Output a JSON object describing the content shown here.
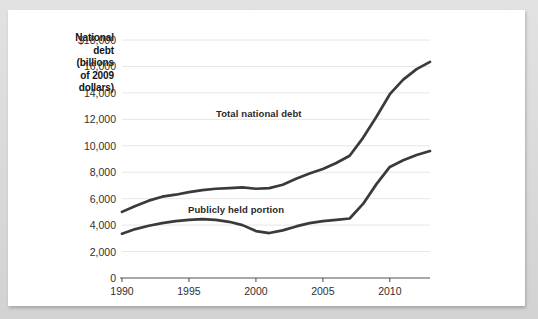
{
  "chart_data": {
    "type": "line",
    "title": "",
    "xlabel": "",
    "ylabel": "National debt (billions of 2009 dollars)",
    "ylabel_lines": [
      "National",
      "debt",
      "(billions",
      "of 2009",
      "dollars)"
    ],
    "xlim": [
      1990,
      2013
    ],
    "ylim": [
      0,
      18000
    ],
    "ytick_values": [
      0,
      2000,
      4000,
      6000,
      8000,
      10000,
      12000,
      14000,
      16000,
      18000
    ],
    "ytick_labels": [
      "0",
      "2,000",
      "4,000",
      "6,000",
      "8,000",
      "10,000",
      "12,000",
      "14,000",
      "16,000",
      "$18,000"
    ],
    "xtick_values": [
      1990,
      1995,
      2000,
      2005,
      2010
    ],
    "xtick_labels": [
      "1990",
      "1995",
      "2000",
      "2005",
      "2010"
    ],
    "grid": true,
    "grid_axis": "y",
    "legend_position": "inline-annotation",
    "line_color": "#3a3a3a",
    "grid_color": "#e6e6e6",
    "axis_color": "#555555",
    "x": [
      1990,
      1991,
      1992,
      1993,
      1994,
      1995,
      1996,
      1997,
      1998,
      1999,
      2000,
      2001,
      2002,
      2003,
      2004,
      2005,
      2006,
      2007,
      2008,
      2009,
      2010,
      2011,
      2012,
      2013
    ],
    "series": [
      {
        "name": "Total national debt",
        "values": [
          5000,
          5450,
          5850,
          6150,
          6300,
          6500,
          6650,
          6750,
          6800,
          6850,
          6750,
          6800,
          7050,
          7500,
          7900,
          8250,
          8700,
          9250,
          10600,
          12200,
          13900,
          15000,
          15800,
          16350
        ]
      },
      {
        "name": "Publicly held portion",
        "values": [
          3350,
          3700,
          3950,
          4150,
          4300,
          4400,
          4450,
          4400,
          4250,
          4000,
          3550,
          3400,
          3600,
          3900,
          4150,
          4300,
          4400,
          4500,
          5600,
          7100,
          8400,
          8900,
          9300,
          9600
        ]
      }
    ],
    "annotations": [
      {
        "text": "Total national debt",
        "x": 2004,
        "y": 12000
      },
      {
        "text": "Publicly held portion",
        "x": 2001,
        "y": 5000
      }
    ]
  }
}
